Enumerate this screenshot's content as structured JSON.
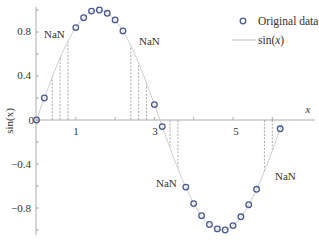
{
  "chart_data": {
    "type": "line",
    "title": "",
    "xlabel": "x",
    "ylabel": "sin(x)",
    "xlim": [
      -0.05,
      7.1
    ],
    "ylim": [
      -1.05,
      1.05
    ],
    "x_ticks": [
      1,
      2,
      3,
      4,
      5,
      6
    ],
    "x_tick_labels": [
      "1",
      "",
      "3",
      "",
      "5",
      ""
    ],
    "y_ticks": [
      -1.0,
      -0.8,
      -0.6,
      -0.4,
      -0.2,
      0,
      0.2,
      0.4,
      0.6,
      0.8,
      1.0
    ],
    "y_tick_labels": [
      "",
      "−0.8",
      "",
      "−0.4",
      "",
      "0",
      "",
      "0.4",
      "",
      "0.8",
      ""
    ],
    "grid": false,
    "legend_position": "upper right",
    "series": [
      {
        "name": "Original data",
        "style": "markers",
        "marker": "circle-open",
        "color": "#4a5a8c",
        "x": [
          0.0,
          0.2,
          1.0,
          1.2,
          1.4,
          1.6,
          1.8,
          2.0,
          2.2,
          3.0,
          3.2,
          3.8,
          4.0,
          4.2,
          4.4,
          4.6,
          4.8,
          5.0,
          5.2,
          5.4,
          5.6,
          6.2
        ],
        "y": [
          0.0,
          0.2,
          0.84,
          0.93,
          0.99,
          1.0,
          0.97,
          0.91,
          0.81,
          0.14,
          -0.06,
          -0.61,
          -0.76,
          -0.87,
          -0.95,
          -0.99,
          -1.0,
          -0.96,
          -0.88,
          -0.77,
          -0.63,
          -0.08
        ]
      },
      {
        "name": "sin(x)",
        "style": "line",
        "color": "#bbbbbb",
        "x": [
          0.0,
          0.2,
          0.4,
          0.6,
          0.8,
          1.0,
          1.2,
          1.4,
          1.6,
          1.8,
          2.0,
          2.2,
          2.4,
          2.6,
          2.8,
          3.0,
          3.2,
          3.4,
          3.6,
          3.8,
          4.0,
          4.2,
          4.4,
          4.6,
          4.8,
          5.0,
          5.2,
          5.4,
          5.6,
          5.8,
          6.0,
          6.2
        ],
        "y": [
          0.0,
          0.2,
          0.39,
          0.56,
          0.72,
          0.84,
          0.93,
          0.99,
          1.0,
          0.97,
          0.91,
          0.81,
          0.68,
          0.52,
          0.33,
          0.14,
          -0.06,
          -0.26,
          -0.44,
          -0.61,
          -0.76,
          -0.87,
          -0.95,
          -0.99,
          -1.0,
          -0.96,
          -0.88,
          -0.77,
          -0.63,
          -0.46,
          -0.28,
          -0.08
        ]
      }
    ],
    "nan_regions": [
      {
        "label": "NaN",
        "x": [
          0.4,
          0.6,
          0.8
        ]
      },
      {
        "label": "NaN",
        "x": [
          2.4,
          2.6,
          2.8
        ]
      },
      {
        "label": "NaN",
        "x": [
          3.4,
          3.6
        ]
      },
      {
        "label": "NaN",
        "x": [
          5.8,
          6.0
        ]
      }
    ],
    "annotations": [
      "NaN",
      "NaN",
      "NaN",
      "NaN"
    ]
  },
  "legend": {
    "items": [
      {
        "label": "Original data",
        "kind": "marker"
      },
      {
        "label": "sin(x)",
        "kind": "line"
      }
    ]
  },
  "axes": {
    "xlabel": "x",
    "ylabel": "sin(x)"
  },
  "annotations": {
    "nan1": "NaN",
    "nan2": "NaN",
    "nan3": "NaN",
    "nan4": "NaN"
  },
  "ticks": {
    "x1": "1",
    "x3": "3",
    "x5": "5",
    "y08": "0.8",
    "y04": "0.4",
    "y0": "0",
    "ym04": "−0.4",
    "ym08": "−0.8"
  }
}
